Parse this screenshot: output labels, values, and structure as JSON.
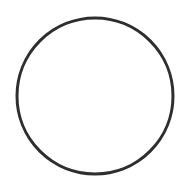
{
  "shape": {
    "type": "circle",
    "cx": 95,
    "cy": 96,
    "r": 78,
    "stroke": "#2e2e2e",
    "stroke_width": 3,
    "fill": "#ffffff"
  }
}
